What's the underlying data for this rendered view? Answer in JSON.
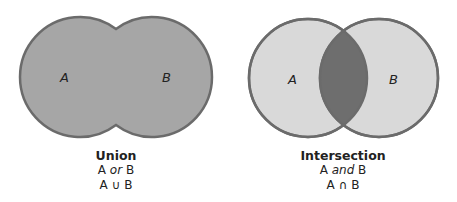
{
  "diagrams": [
    {
      "id": "union",
      "set_a_label": "A",
      "set_b_label": "B",
      "title": "Union",
      "line1_pre": "A ",
      "line1_word": "or",
      "line1_post": " B",
      "notation": "A ∪ B",
      "fill_color": "#a6a6a6",
      "stroke_color": "#6b6b6b"
    },
    {
      "id": "intersection",
      "set_a_label": "A",
      "set_b_label": "B",
      "title": "Intersection",
      "line1_pre": "A ",
      "line1_word": "and",
      "line1_post": " B",
      "notation": "A ∩ B",
      "fill_color": "#d9d9d9",
      "highlight_color": "#6e6e6e",
      "stroke_color": "#6b6b6b"
    }
  ]
}
